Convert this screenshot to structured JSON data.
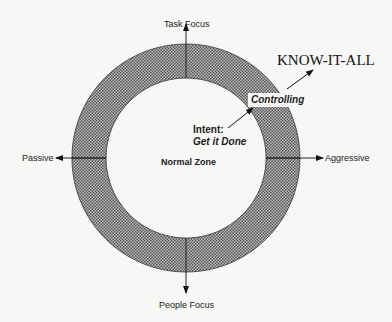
{
  "diagram": {
    "axes": {
      "top": "Task Focus",
      "bottom": "People Focus",
      "left": "Passive",
      "right": "Aggressive"
    },
    "center_label": "Normal Zone",
    "intent": {
      "label": "Intent:",
      "value": "Get it Done"
    },
    "controlling_label": "Controlling",
    "outer_label": "KNOW-IT-ALL",
    "colors": {
      "ring_fill": "#8a8a8a",
      "line": "#222222",
      "background": "#f7f7f5"
    }
  }
}
